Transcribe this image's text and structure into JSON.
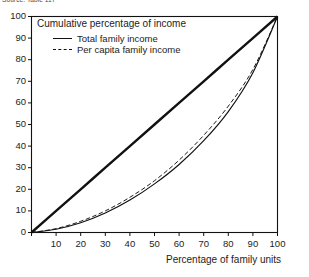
{
  "figure": {
    "source_note": "Source: Table 117",
    "plot_heading": "Cumulative percentage of income",
    "x_axis_title": "Percentage of family units"
  },
  "chart_data": {
    "type": "line",
    "title": "",
    "subtitle": "",
    "xlabel": "Percentage of family units",
    "ylabel": "Cumulative percentage of income",
    "xlim": [
      0,
      100
    ],
    "ylim": [
      0,
      100
    ],
    "grid": false,
    "legend_position": "top-left-inside",
    "x_ticks": [
      0,
      10,
      20,
      30,
      40,
      50,
      60,
      70,
      80,
      90,
      100
    ],
    "x_tick_labels": [
      "",
      "10",
      "20",
      "30",
      "40",
      "50",
      "60",
      "70",
      "80",
      "90",
      "100"
    ],
    "y_ticks": [
      0,
      10,
      20,
      30,
      40,
      50,
      60,
      70,
      80,
      90,
      100
    ],
    "y_tick_labels": [
      "0",
      "10",
      "20",
      "30",
      "40",
      "50",
      "60",
      "70",
      "80",
      "90",
      "100"
    ],
    "x": [
      0,
      10,
      20,
      30,
      40,
      50,
      60,
      70,
      80,
      90,
      100
    ],
    "series": [
      {
        "name": "Line of equality",
        "style": "solid-thick",
        "color": "#111111",
        "show_in_legend": false,
        "values": [
          0,
          10,
          20,
          30,
          40,
          50,
          60,
          70,
          80,
          90,
          100
        ]
      },
      {
        "name": "Total family income",
        "style": "solid",
        "color": "#111111",
        "show_in_legend": true,
        "values": [
          0,
          1.5,
          4.5,
          9.0,
          15.0,
          22.5,
          31.5,
          42.5,
          56.0,
          74.0,
          100
        ]
      },
      {
        "name": "Per capita family income",
        "style": "dashed",
        "color": "#111111",
        "show_in_legend": true,
        "values": [
          0,
          1.8,
          5.2,
          10.0,
          16.3,
          24.0,
          33.5,
          45.0,
          58.5,
          75.5,
          100
        ]
      }
    ],
    "legend_entries": [
      {
        "label": "Total family income",
        "style": "solid"
      },
      {
        "label": "Per capita family income",
        "style": "dashed"
      }
    ]
  }
}
